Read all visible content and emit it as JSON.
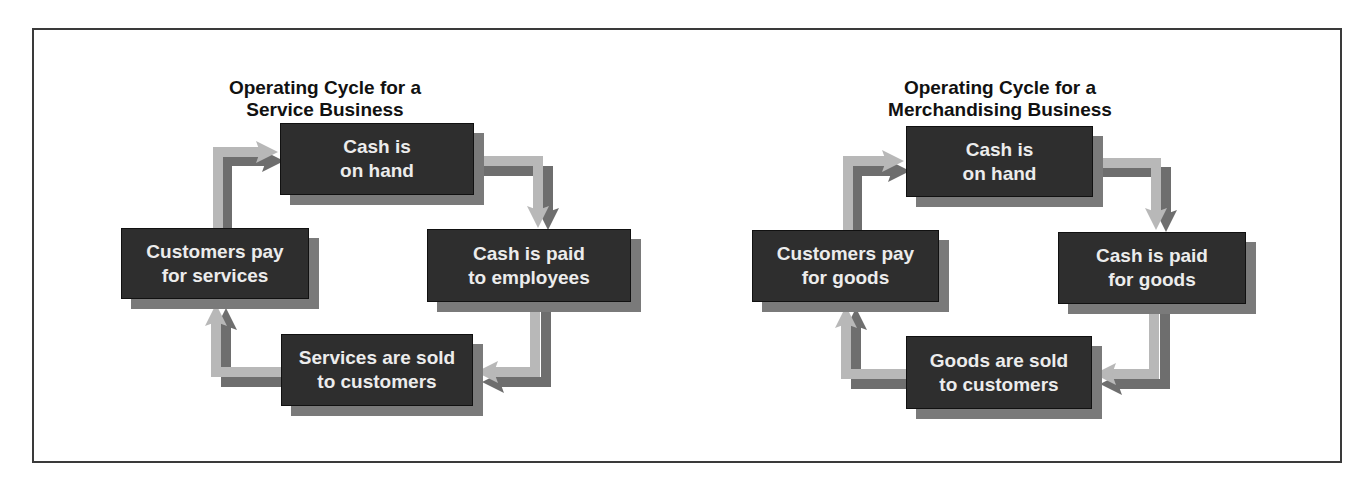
{
  "diagrams": [
    {
      "title": "Operating Cycle for a\nService Business",
      "nodes": {
        "top": "Cash is\non hand",
        "right": "Cash is paid\nto employees",
        "bottom": "Services are sold\nto customers",
        "left": "Customers pay\nfor services"
      }
    },
    {
      "title": "Operating Cycle for a\nMerchandising Business",
      "nodes": {
        "top": "Cash is\non hand",
        "right": "Cash is paid\nfor goods",
        "bottom": "Goods are sold\nto customers",
        "left": "Customers pay\nfor goods"
      }
    }
  ],
  "colors": {
    "box": "#2e2e2e",
    "box_shadow": "#7a7a7a",
    "arrow_light": "#b8b8b8",
    "arrow_dark": "#6e6e6e",
    "frame": "#3a3a3a"
  }
}
